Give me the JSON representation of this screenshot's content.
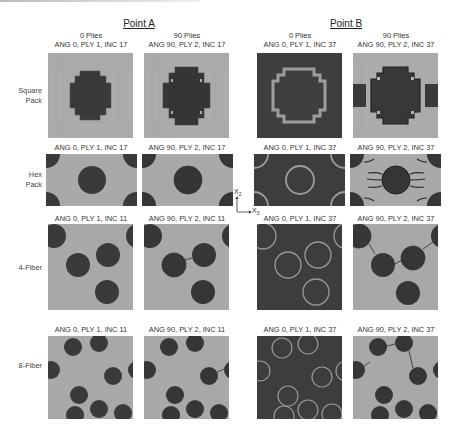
{
  "figure": {
    "points": [
      {
        "title": "Point A"
      },
      {
        "title": "Point B"
      }
    ],
    "column_headers": [
      {
        "plies": "0 Plies",
        "label": "ANG 0, PLY 1, INC 17"
      },
      {
        "plies": "90 Plies",
        "label": "ANG 90, PLY 2, INC 17"
      },
      {
        "plies": "0 Plies",
        "label": "ANG 0, PLY 1, INC 37"
      },
      {
        "plies": "90 Plies",
        "label": "ANG 90, PLY 2, INC 37"
      }
    ],
    "row_labels": [
      "Square Pack",
      "Hex Pack",
      "4-Fiber",
      "8-Fiber"
    ],
    "row_label_lines": [
      [
        "Square",
        "Pack"
      ],
      [
        "Hex",
        "Pack"
      ],
      [
        "4-Fiber"
      ],
      [
        "8-Fiber"
      ]
    ],
    "panel_captions": [
      [
        "ANG 0, PLY 1, INC 17",
        "ANG 90, PLY 2, INC 17",
        "ANG 0, PLY 1, INC 37",
        "ANG 90, PLY 2, INC 37"
      ],
      [
        "ANG 0, PLY 1, INC 17",
        "ANG 90, PLY 2, INC 17",
        "ANG 0, PLY 1, INC 37",
        "ANG 90, PLY 2, INC 37"
      ],
      [
        "ANG 0, PLY 1, INC 11",
        "ANG 90, PLY 2, INC 11",
        "ANG 0, PLY 1, INC 37",
        "ANG 90, PLY 2, INC 37"
      ],
      [
        "ANG 0, PLY 1, INC 11",
        "ANG 90, PLY 2, INC 11",
        "ANG 0, PLY 1, INC 37",
        "ANG 90, PLY 2, INC 37"
      ]
    ],
    "axis": {
      "vertical": "X",
      "vertical_sub": "2",
      "horizontal": "X",
      "horizontal_sub": "3"
    },
    "colors": {
      "matrix_light": "#a9a9a9",
      "fiber_dark": "#3a3a3a",
      "ring_light": "#9c9c9c",
      "background_dark": "#3d3d3d"
    }
  }
}
